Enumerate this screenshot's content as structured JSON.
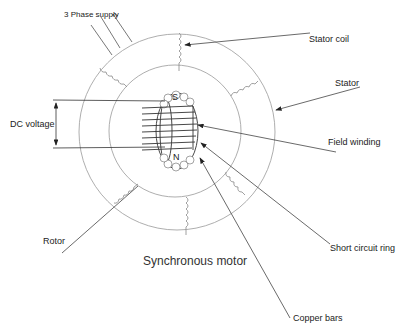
{
  "diagram": {
    "title": "Synchronous motor",
    "labels": {
      "supply": "3 Phase supply",
      "stator_coil": "Stator coil",
      "stator": "Stator",
      "dc_voltage": "DC voltage",
      "field_winding": "Field winding",
      "rotor": "Rotor",
      "short_circuit_ring": "Short circuit ring",
      "copper_bars": "Copper bars",
      "pole_south": "S",
      "pole_north": "N"
    },
    "colors": {
      "line": "#555555",
      "circle": "#999999",
      "text": "#222222",
      "background": "#ffffff"
    }
  }
}
